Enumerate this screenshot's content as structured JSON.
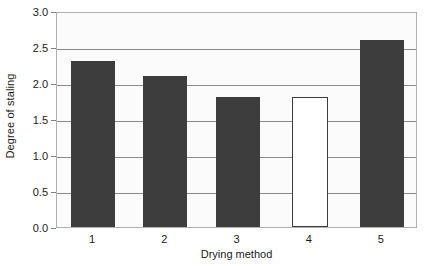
{
  "chart_data": {
    "type": "bar",
    "title": "",
    "xlabel": "Drying method",
    "ylabel": "Degree of staling",
    "categories": [
      "1",
      "2",
      "3",
      "4",
      "5"
    ],
    "values": [
      2.3,
      2.1,
      1.8,
      1.8,
      2.6
    ],
    "bar_styles": [
      "filled",
      "filled",
      "filled",
      "hollow",
      "filled"
    ],
    "ylim": [
      0.0,
      3.0
    ],
    "ytick_labels": [
      "0.0",
      "0.5",
      "1.0",
      "1.5",
      "2.0",
      "2.5",
      "3.0"
    ],
    "ytick_values": [
      0.0,
      0.5,
      1.0,
      1.5,
      2.0,
      2.5,
      3.0
    ],
    "grid": true,
    "grid_axis": "y",
    "legend": false,
    "legend_position": "none",
    "colors": {
      "bar_fill": "#3d3d3d",
      "bar_hollow_fill": "#ffffff",
      "bar_outline": "#3d3d3d",
      "plot_background": "#fbfbfb",
      "plot_border": "#b0b0b0",
      "gridline": "#8a8a8a",
      "text": "#1a1a1a",
      "page_background": "#ffffff"
    }
  }
}
